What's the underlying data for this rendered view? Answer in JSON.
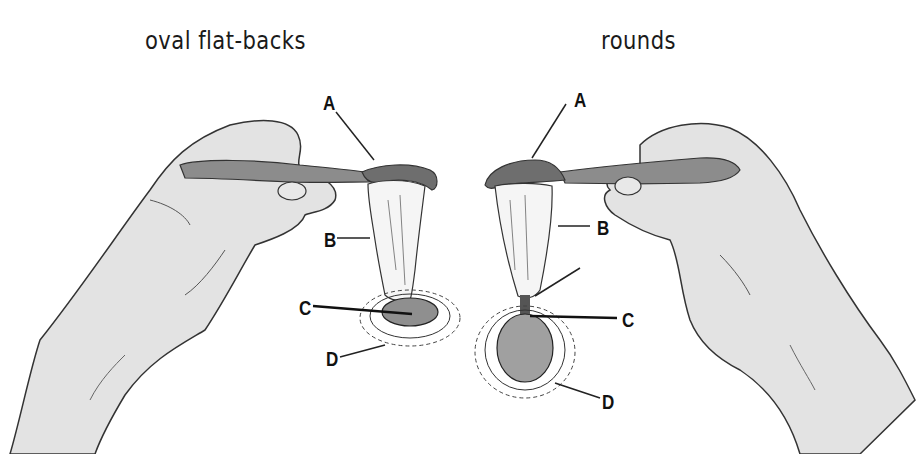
{
  "titles": {
    "left": "oval flat-backs",
    "right": "rounds"
  },
  "panels": {
    "left": {
      "labels": {
        "a": "A",
        "b": "B",
        "c": "C",
        "d": "D"
      }
    },
    "right": {
      "labels": {
        "a": "A",
        "b": "B",
        "c": "C",
        "d": "D"
      }
    }
  },
  "colors": {
    "background": "#ffffff",
    "ink": "#1a1a1a",
    "spoon": "#8a8a8a",
    "spoon_bowl": "#6e6e6e",
    "skin": "#e2e2e2",
    "fabric": "#f4f4f4",
    "stone": "#9a9a9a"
  }
}
